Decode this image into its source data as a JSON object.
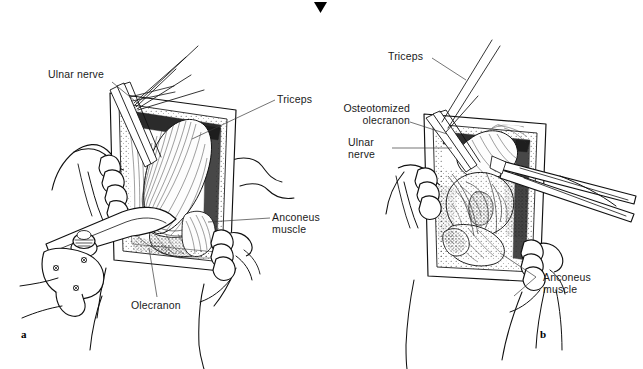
{
  "figure": {
    "kind": "surgical-anatomy-line-illustration",
    "background_color": "#ffffff",
    "ink_color": "#111111",
    "top_marker": {
      "name": "page-crop-marker",
      "shape": "solid-downward-triangle",
      "color": "#000000"
    },
    "panels": [
      {
        "id": "a",
        "letter": "a",
        "description": "Olecranon exposed; triceps tendon and ulnar nerve identified, wound held open by self-retaining retractor and assistant's fingers",
        "labels": [
          {
            "key": "ulnar_nerve",
            "text": "Ulnar nerve",
            "lines": [
              "Ulnar nerve"
            ],
            "align": "left"
          },
          {
            "key": "triceps",
            "text": "Triceps",
            "lines": [
              "Triceps"
            ],
            "align": "left"
          },
          {
            "key": "anconeus_muscle",
            "text": "Anconeus muscle",
            "lines": [
              "Anconeus",
              "muscle"
            ],
            "align": "left"
          },
          {
            "key": "olecranon",
            "text": "Olecranon",
            "lines": [
              "Olecranon"
            ],
            "align": "left"
          }
        ]
      },
      {
        "id": "b",
        "letter": "b",
        "description": "Osteotomized olecranon reflected proximally with the triceps, exposing the distal humeral articular surface",
        "labels": [
          {
            "key": "triceps",
            "text": "Triceps",
            "lines": [
              "Triceps"
            ],
            "align": "left"
          },
          {
            "key": "osteotomized_olecranon",
            "text": "Osteotomized olecranon",
            "lines": [
              "Osteotomized",
              "olecranon"
            ],
            "align": "right"
          },
          {
            "key": "ulnar_nerve",
            "text": "Ulnar nerve",
            "lines": [
              "Ulnar",
              "nerve"
            ],
            "align": "left"
          },
          {
            "key": "anconeus_muscle",
            "text": "Anconeus muscle",
            "lines": [
              "Anconeus",
              "muscle"
            ],
            "align": "left"
          }
        ]
      }
    ]
  },
  "labels_flat": {
    "a_ulnar_nerve": "Ulnar nerve",
    "a_triceps": "Triceps",
    "a_anconeus_muscle": "Anconeus\nmuscle",
    "a_olecranon": "Olecranon",
    "a_letter": "a",
    "b_triceps": "Triceps",
    "b_osteotomized_olecranon": "Osteotomized\nolecranon",
    "b_ulnar_nerve": "Ulnar\nnerve",
    "b_anconeus_muscle": "Anconeus\nmuscle",
    "b_letter": "b"
  }
}
